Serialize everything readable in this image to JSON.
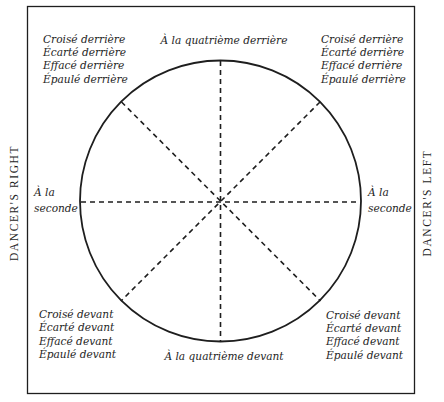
{
  "diagram": {
    "side_labels": {
      "left": "DANCER'S RIGHT",
      "right": "DANCER'S LEFT"
    },
    "top_center": "À la quatrième derrière",
    "bottom_center": "À la quatrième devant",
    "left_middle": [
      "À la",
      "seconde"
    ],
    "right_middle": [
      "À la",
      "seconde"
    ],
    "top_left": [
      "Croisé derrière",
      "Écarté derrière",
      "Effacé derrière",
      "Épaulé derrière"
    ],
    "top_right": [
      "Croisé derrière",
      "Écarté derrière",
      "Effacé derrière",
      "Épaulé derrière"
    ],
    "bottom_left": [
      "Croisé devant",
      "Écarté devant",
      "Effacé devant",
      "Épaulé devant"
    ],
    "bottom_right": [
      "Croisé devant",
      "Écarté devant",
      "Effacé devant",
      "Épaulé devant"
    ],
    "colors": {
      "ink": "#1e1e1e",
      "background": "#ffffff"
    }
  }
}
